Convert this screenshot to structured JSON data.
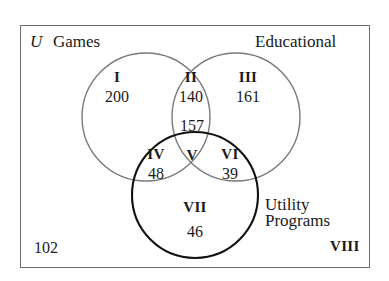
{
  "diagram": {
    "type": "venn-3-set",
    "universe_symbol": "U",
    "set_labels": {
      "games": "Games",
      "educational": "Educational",
      "utility_line1": "Utility",
      "utility_line2": "Programs"
    },
    "outside_count": "102",
    "regions": [
      {
        "roman": "I",
        "count": "200",
        "meaning": "games-only"
      },
      {
        "roman": "II",
        "count": "140",
        "meaning": "games-and-educational"
      },
      {
        "roman": "III",
        "count": "161",
        "meaning": "educational-only"
      },
      {
        "roman": "IV",
        "count": "48",
        "meaning": "games-and-utility"
      },
      {
        "roman": "V",
        "count": "157",
        "meaning": "all-three"
      },
      {
        "roman": "VI",
        "count": "39",
        "meaning": "educational-and-utility"
      },
      {
        "roman": "VII",
        "count": "46",
        "meaning": "utility-only"
      },
      {
        "roman": "VIII",
        "count": "102",
        "meaning": "outside-all-sets"
      }
    ],
    "colors": {
      "circle_games": "#7a7a7d",
      "circle_educational": "#7a7a7d",
      "circle_utility": "#111111",
      "universe_border": "#6f6f72",
      "text": "#1a1a1a"
    }
  }
}
